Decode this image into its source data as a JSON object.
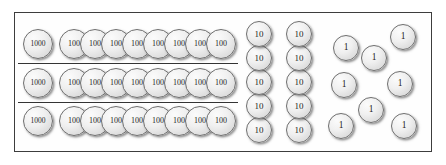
{
  "diagram": {
    "frame": {
      "border_color": "#3d3d3d",
      "background_color": "#fefefe"
    },
    "coin_style": {
      "outline_color": "#6e6e6e",
      "face_color": "#f0f0f0",
      "label_color": "#1d1d1d"
    },
    "dividers": [
      {
        "x": 17,
        "y": 62,
        "width": 220
      },
      {
        "x": 17,
        "y": 101,
        "width": 220
      }
    ],
    "groups": [
      {
        "name": "thousands-and-hundreds-rows",
        "rows": [
          {
            "name": "row-1",
            "thousand_coin": {
              "label": "1000",
              "x": 22,
              "y": 28
            },
            "hundred_coins": [
              {
                "label": "100",
                "x": 58,
                "y": 28
              },
              {
                "label": "100",
                "x": 79,
                "y": 28
              },
              {
                "label": "100",
                "x": 100,
                "y": 28
              },
              {
                "label": "100",
                "x": 121,
                "y": 28
              },
              {
                "label": "100",
                "x": 142,
                "y": 28
              },
              {
                "label": "100",
                "x": 163,
                "y": 28
              },
              {
                "label": "100",
                "x": 184,
                "y": 28
              },
              {
                "label": "100",
                "x": 205,
                "y": 28
              }
            ]
          },
          {
            "name": "row-2",
            "thousand_coin": {
              "label": "1000",
              "x": 22,
              "y": 67
            },
            "hundred_coins": [
              {
                "label": "100",
                "x": 58,
                "y": 67
              },
              {
                "label": "100",
                "x": 79,
                "y": 67
              },
              {
                "label": "100",
                "x": 100,
                "y": 67
              },
              {
                "label": "100",
                "x": 121,
                "y": 67
              },
              {
                "label": "100",
                "x": 142,
                "y": 67
              },
              {
                "label": "100",
                "x": 163,
                "y": 67
              },
              {
                "label": "100",
                "x": 184,
                "y": 67
              },
              {
                "label": "100",
                "x": 205,
                "y": 67
              }
            ]
          },
          {
            "name": "row-3",
            "thousand_coin": {
              "label": "1000",
              "x": 22,
              "y": 105
            },
            "hundred_coins": [
              {
                "label": "100",
                "x": 58,
                "y": 105
              },
              {
                "label": "100",
                "x": 79,
                "y": 105
              },
              {
                "label": "100",
                "x": 100,
                "y": 105
              },
              {
                "label": "100",
                "x": 121,
                "y": 105
              },
              {
                "label": "100",
                "x": 142,
                "y": 105
              },
              {
                "label": "100",
                "x": 163,
                "y": 105
              },
              {
                "label": "100",
                "x": 184,
                "y": 105
              },
              {
                "label": "100",
                "x": 205,
                "y": 105
              }
            ]
          }
        ]
      },
      {
        "name": "tens-columns",
        "coins": [
          {
            "label": "10",
            "x": 245,
            "y": 20
          },
          {
            "label": "10",
            "x": 245,
            "y": 44
          },
          {
            "label": "10",
            "x": 245,
            "y": 68
          },
          {
            "label": "10",
            "x": 245,
            "y": 92
          },
          {
            "label": "10",
            "x": 245,
            "y": 116
          },
          {
            "label": "10",
            "x": 285,
            "y": 20
          },
          {
            "label": "10",
            "x": 285,
            "y": 44
          },
          {
            "label": "10",
            "x": 285,
            "y": 68
          },
          {
            "label": "10",
            "x": 285,
            "y": 92
          },
          {
            "label": "10",
            "x": 285,
            "y": 116
          }
        ]
      },
      {
        "name": "ones-scatter",
        "coins": [
          {
            "label": "1",
            "x": 389,
            "y": 23
          },
          {
            "label": "1",
            "x": 332,
            "y": 34
          },
          {
            "label": "1",
            "x": 360,
            "y": 44
          },
          {
            "label": "1",
            "x": 330,
            "y": 71
          },
          {
            "label": "1",
            "x": 386,
            "y": 70
          },
          {
            "label": "1",
            "x": 357,
            "y": 96
          },
          {
            "label": "1",
            "x": 327,
            "y": 112
          },
          {
            "label": "1",
            "x": 390,
            "y": 112
          }
        ]
      }
    ]
  }
}
